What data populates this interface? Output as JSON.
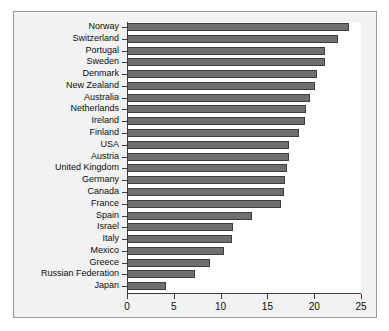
{
  "chart_data": {
    "type": "bar",
    "orientation": "horizontal",
    "title": "",
    "subtitle": "",
    "xlabel": "",
    "ylabel": "",
    "xlim": [
      0,
      25
    ],
    "xticks": [
      0,
      5,
      10,
      15,
      20,
      25
    ],
    "xtick_labels": [
      "0",
      "5",
      "10",
      "15",
      "20",
      "25"
    ],
    "grid": false,
    "legend": null,
    "bar_color": "#6f6f6f",
    "bar_edge_color": "#3d3d3d",
    "plot_background": "#ffffff",
    "figure_background": "#f2f2f2",
    "axis_color": "#3a3a3a",
    "categories": [
      "Norway",
      "Switzerland",
      "Portugal",
      "Sweden",
      "Denmark",
      "New Zealand",
      "Australia",
      "Netherlands",
      "Ireland",
      "Finland",
      "USA",
      "Austria",
      "United Kingdom",
      "Germany",
      "Canada",
      "France",
      "Spain",
      "Israel",
      "Italy",
      "Mexico",
      "Greece",
      "Russian Federation",
      "Japan"
    ],
    "values": [
      23.7,
      22.5,
      21.2,
      21.2,
      20.3,
      20.1,
      19.5,
      19.1,
      19.0,
      18.4,
      17.3,
      17.3,
      17.1,
      16.9,
      16.8,
      16.4,
      13.4,
      11.3,
      11.2,
      10.4,
      8.9,
      7.3,
      4.2
    ]
  }
}
